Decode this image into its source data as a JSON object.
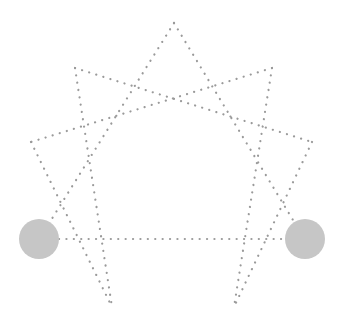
{
  "diagram": {
    "type": "enneagram-star",
    "width": 343,
    "height": 334,
    "line_color": "#9a9a9a",
    "node_color": "#c6c6c6",
    "vertices": {
      "top": [
        174,
        23
      ],
      "upper_left": [
        75,
        68
      ],
      "upper_right": [
        272,
        68
      ],
      "left": [
        31,
        142
      ],
      "right": [
        312,
        142
      ],
      "left_node": [
        39,
        239
      ],
      "right_node": [
        305,
        239
      ],
      "bottom_left": [
        112,
        307
      ],
      "bottom_right": [
        234,
        307
      ]
    },
    "edges": [
      {
        "from": [
          174,
          23
        ],
        "to": [
          48,
          225
        ]
      },
      {
        "from": [
          174,
          23
        ],
        "to": [
          296,
          225
        ]
      },
      {
        "from": [
          75,
          68
        ],
        "to": [
          312,
          142
        ]
      },
      {
        "from": [
          272,
          68
        ],
        "to": [
          31,
          142
        ]
      },
      {
        "from": [
          75,
          68
        ],
        "to": [
          112,
          307
        ]
      },
      {
        "from": [
          272,
          68
        ],
        "to": [
          234,
          307
        ]
      },
      {
        "from": [
          31,
          142
        ],
        "to": [
          112,
          307
        ]
      },
      {
        "from": [
          312,
          142
        ],
        "to": [
          234,
          307
        ]
      },
      {
        "from": [
          59,
          239
        ],
        "to": [
          285,
          239
        ]
      }
    ],
    "nodes": [
      {
        "name": "left-node",
        "cx": 39,
        "cy": 239,
        "r": 20
      },
      {
        "name": "right-node",
        "cx": 305,
        "cy": 239,
        "r": 20
      }
    ]
  }
}
